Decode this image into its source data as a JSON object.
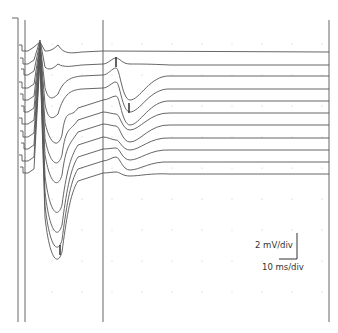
{
  "chart_data": {
    "type": "line",
    "title": "",
    "xlabel": "",
    "ylabel": "",
    "scale_bar": {
      "vertical": "2 mV/div",
      "horizontal": "10 ms/div"
    },
    "grid": "dotted",
    "legend": null,
    "cursors_x_px": [
      18,
      25,
      103,
      329
    ],
    "trace_count": 11,
    "baselines_y_px": [
      51,
      64,
      75,
      88,
      100,
      112,
      124,
      137,
      149,
      161,
      173
    ],
    "annotations": [
      {
        "type": "marker",
        "label": "peak marker (trace 2)",
        "x_px": 116,
        "y_px": 62
      },
      {
        "type": "marker",
        "label": "trough marker (trace 4)",
        "x_px": 129,
        "y_px": 108
      },
      {
        "type": "marker",
        "label": "trough marker (bottom trace)",
        "x_px": 60,
        "y_px": 250
      }
    ],
    "series": [
      {
        "name": "trace 1",
        "baseline": 51,
        "early_peak": 42,
        "early_trough": 51,
        "late_deflection": 0
      },
      {
        "name": "trace 2",
        "baseline": 64,
        "early_peak": 40,
        "early_trough": 70,
        "late_peak": 58,
        "late_trough": 0
      },
      {
        "name": "trace 3",
        "baseline": 75,
        "early_peak": 42,
        "early_trough": 100,
        "late_peak": 68,
        "late_trough": 100
      },
      {
        "name": "trace 4",
        "baseline": 88,
        "early_peak": 44,
        "early_trough": 120,
        "late_peak": 82,
        "late_trough": 112
      },
      {
        "name": "trace 5",
        "baseline": 100,
        "early_peak": 46,
        "early_trough": 145,
        "late_peak": 96,
        "late_trough": 125
      },
      {
        "name": "trace 6",
        "baseline": 112,
        "early_peak": 48,
        "early_trough": 165,
        "late_peak": 114,
        "late_trough": 130
      },
      {
        "name": "trace 7",
        "baseline": 124,
        "early_peak": 50,
        "early_trough": 185,
        "late_peak": 126,
        "late_trough": 142
      },
      {
        "name": "trace 8",
        "baseline": 137,
        "early_peak": 52,
        "early_trough": 215,
        "late_peak": 140,
        "late_trough": 150
      },
      {
        "name": "trace 9",
        "baseline": 149,
        "early_peak": 54,
        "early_trough": 235,
        "late_peak": 148,
        "late_trough": 160
      },
      {
        "name": "trace 10",
        "baseline": 161,
        "early_peak": 56,
        "early_trough": 250,
        "late_peak": 157,
        "late_trough": 170
      },
      {
        "name": "trace 11",
        "baseline": 173,
        "early_peak": 58,
        "early_trough": 262,
        "late_peak": 172,
        "late_trough": 176
      }
    ],
    "colors": {
      "trace": "#555555",
      "cursor": "#666666",
      "grid_dot": "#c8c8c8"
    }
  }
}
